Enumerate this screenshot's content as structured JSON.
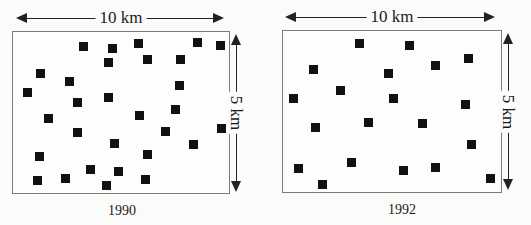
{
  "panels": [
    {
      "year": "1990",
      "width_label": "10 km",
      "height_label": "5 km",
      "box": {
        "x": 12,
        "y": 31,
        "w": 218,
        "h": 163
      },
      "harrow": {
        "x1": 16,
        "x2": 224,
        "y": 12,
        "label_x": 121
      },
      "varrow": {
        "x": 236,
        "y1": 34,
        "y2": 192,
        "label_y": 113
      },
      "year_pos": {
        "x": 122,
        "y": 203
      },
      "markers": [
        [
          70,
          14
        ],
        [
          99,
          16
        ],
        [
          95,
          30
        ],
        [
          27,
          41
        ],
        [
          56,
          49
        ],
        [
          14,
          60
        ],
        [
          64,
          70
        ],
        [
          95,
          65
        ],
        [
          35,
          86
        ],
        [
          64,
          100
        ],
        [
          101,
          111
        ],
        [
          26,
          124
        ],
        [
          77,
          137
        ],
        [
          105,
          139
        ],
        [
          24,
          148
        ],
        [
          52,
          146
        ],
        [
          93,
          153
        ],
        [
          125,
          11
        ],
        [
          184,
          10
        ],
        [
          207,
          13
        ],
        [
          134,
          27
        ],
        [
          167,
          27
        ],
        [
          166,
          53
        ],
        [
          126,
          83
        ],
        [
          162,
          77
        ],
        [
          152,
          99
        ],
        [
          208,
          96
        ],
        [
          180,
          112
        ],
        [
          134,
          122
        ],
        [
          132,
          147
        ]
      ]
    },
    {
      "year": "1992",
      "width_label": "10 km",
      "height_label": "5 km",
      "box": {
        "x": 282,
        "y": 30,
        "w": 220,
        "h": 163
      },
      "harrow": {
        "x1": 285,
        "x2": 495,
        "y": 11,
        "label_x": 392
      },
      "varrow": {
        "x": 508,
        "y1": 33,
        "y2": 190,
        "label_y": 112
      },
      "year_pos": {
        "x": 402,
        "y": 202
      },
      "markers": [
        [
          76,
          12
        ],
        [
          30,
          38
        ],
        [
          105,
          42
        ],
        [
          57,
          59
        ],
        [
          10,
          67
        ],
        [
          110,
          67
        ],
        [
          32,
          96
        ],
        [
          85,
          91
        ],
        [
          68,
          131
        ],
        [
          15,
          137
        ],
        [
          39,
          153
        ],
        [
          126,
          14
        ],
        [
          185,
          27
        ],
        [
          152,
          34
        ],
        [
          182,
          73
        ],
        [
          139,
          92
        ],
        [
          188,
          113
        ],
        [
          120,
          139
        ],
        [
          152,
          136
        ],
        [
          207,
          147
        ]
      ]
    }
  ],
  "colors": {
    "marker": "#111111",
    "border": "#7a7a7a",
    "arrow": "#222222",
    "background": "#fbfbfa"
  }
}
